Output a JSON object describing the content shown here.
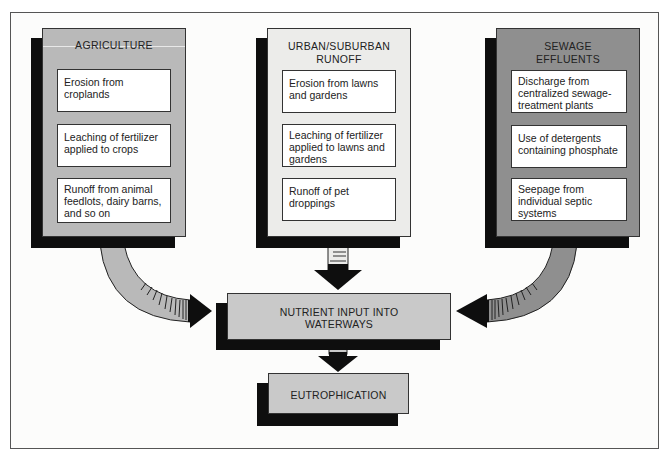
{
  "diagram": {
    "sources": [
      {
        "title": "AGRICULTURE",
        "fill": "#b9b9b9",
        "items": [
          "Erosion from croplands",
          "Leaching of fertilizer applied to crops",
          "Runoff from animal feedlots, dairy barns, and so on"
        ]
      },
      {
        "title_line1": "URBAN/SUBURBAN",
        "title_line2": "RUNOFF",
        "fill": "#ececea",
        "items": [
          "Erosion from lawns and gardens",
          "Leaching of fertilizer applied to lawns and gardens",
          "Runoff of pet droppings"
        ]
      },
      {
        "title_line1": "SEWAGE",
        "title_line2": "EFFLUENTS",
        "fill": "#8f8f8f",
        "items": [
          "Discharge from centralized sewage-treatment plants",
          "Use of detergents containing phosphate",
          "Seepage from individual septic systems"
        ]
      }
    ],
    "nutrient_box": {
      "line1": "NUTRIENT INPUT INTO",
      "line2": "WATERWAYS"
    },
    "result_box": {
      "label": "EUTROPHICATION"
    },
    "colors": {
      "shadow": "#0e0e0e",
      "flow_box_fill": "#c9c9c9",
      "item_fill": "#ffffff"
    }
  }
}
